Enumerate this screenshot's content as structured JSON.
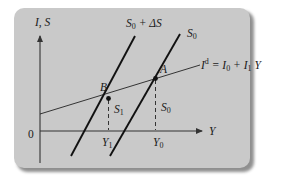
{
  "diagram": {
    "type": "economics-savings-investment",
    "axes": {
      "y_label": "I, S",
      "x_label": "Y",
      "origin_label": "0"
    },
    "curves": {
      "investment": {
        "label_main": "I",
        "label_sup": "d",
        "label_eq": " = I",
        "label_sub0": "0",
        "label_plus": " + I",
        "label_sub1": "1",
        "label_tail": " Y"
      },
      "savings_shifted": {
        "label_main": "S",
        "label_sub": "0",
        "label_tail": " + ΔS"
      },
      "savings_original": {
        "label_main": "S",
        "label_sub": "0"
      }
    },
    "points": {
      "B": "B",
      "A": "A"
    },
    "drop_labels": {
      "s1_main": "S",
      "s1_sub": "1",
      "s0_main": "S",
      "s0_sub": "0"
    },
    "x_ticks": {
      "y1_main": "Y",
      "y1_sub": "1",
      "y0_main": "Y",
      "y0_sub": "0"
    },
    "colors": {
      "card": "#c9c9c9",
      "line": "#111111",
      "axis": "#333333"
    }
  }
}
